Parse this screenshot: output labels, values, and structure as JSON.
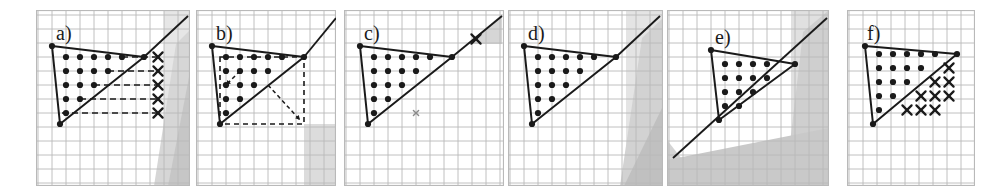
{
  "figure": {
    "panel_count": 6,
    "background_color": "#ffffff",
    "grid_color": "#b9b9b9",
    "ink_color": "#1a1a1a",
    "shade_light": "#e3e3e3",
    "shade_mid": "#d2d2d2",
    "shade_dark": "#bdbdbd"
  },
  "chart_data": {
    "type": "scatter",
    "xlabel": "",
    "ylabel": "",
    "grid": true,
    "legend": null,
    "panels": [
      {
        "id": "a",
        "label": "a)",
        "x": 36,
        "y": 10,
        "w": 154,
        "h": 176,
        "cell": 14,
        "triangle": [
          [
            16,
            36
          ],
          [
            24,
            114
          ],
          [
            108,
            47
          ]
        ],
        "ray_from": [
          108,
          47
        ],
        "ray_to": [
          152,
          6
        ],
        "dots": [
          [
            30,
            47
          ],
          [
            44,
            47
          ],
          [
            58,
            47
          ],
          [
            72,
            47
          ],
          [
            86,
            47
          ],
          [
            30,
            61
          ],
          [
            44,
            61
          ],
          [
            58,
            61
          ],
          [
            72,
            61
          ],
          [
            30,
            75
          ],
          [
            44,
            75
          ],
          [
            58,
            75
          ],
          [
            30,
            89
          ],
          [
            44,
            89
          ],
          [
            30,
            103
          ]
        ],
        "crosses": [
          [
            122,
            47
          ],
          [
            122,
            61
          ],
          [
            122,
            75
          ],
          [
            122,
            89
          ],
          [
            122,
            103
          ]
        ],
        "dashed_rows": [
          [
            86,
            47,
            122,
            47
          ],
          [
            72,
            61,
            122,
            61
          ],
          [
            58,
            75,
            122,
            75
          ],
          [
            44,
            89,
            122,
            89
          ],
          [
            26,
            103,
            122,
            103
          ]
        ],
        "shading": [
          {
            "shape": "poly",
            "points": "128,0 154,0 154,176 128,176",
            "tone": "#e6e6e6"
          },
          {
            "shape": "poly",
            "points": "140,34 154,20 154,176 118,176",
            "tone": "#d6d6d6"
          },
          {
            "shape": "poly",
            "points": "154,62 154,176 132,176",
            "tone": "#c6c6c6"
          }
        ]
      },
      {
        "id": "b",
        "label": "b)",
        "x": 196,
        "y": 10,
        "w": 140,
        "h": 176,
        "cell": 14,
        "triangle": [
          [
            16,
            36
          ],
          [
            24,
            114
          ],
          [
            108,
            47
          ]
        ],
        "ray_from": [
          108,
          47
        ],
        "ray_to": [
          140,
          8
        ],
        "dots": [
          [
            30,
            47
          ],
          [
            44,
            47
          ],
          [
            58,
            47
          ],
          [
            72,
            47
          ],
          [
            86,
            47
          ],
          [
            30,
            61
          ],
          [
            44,
            61
          ],
          [
            58,
            61
          ],
          [
            72,
            61
          ],
          [
            30,
            75
          ],
          [
            44,
            75
          ],
          [
            58,
            75
          ],
          [
            30,
            89
          ],
          [
            44,
            89
          ],
          [
            30,
            103
          ]
        ],
        "crosses": [],
        "dashed_box": [
          24,
          47,
          108,
          114
        ],
        "dashed_arrows": [
          [
            [
              44,
              61
            ],
            [
              30,
              75
            ]
          ],
          [
            [
              72,
              75
            ],
            [
              104,
              110
            ]
          ]
        ],
        "shading": [
          {
            "shape": "rect",
            "x": 108,
            "y": 114,
            "w": 32,
            "h": 62,
            "tone": "#dcdcdc"
          }
        ]
      },
      {
        "id": "c",
        "label": "c)",
        "x": 344,
        "y": 10,
        "w": 160,
        "h": 176,
        "cell": 14,
        "triangle": [
          [
            16,
            36
          ],
          [
            24,
            114
          ],
          [
            108,
            47
          ]
        ],
        "ray_from": [
          108,
          47
        ],
        "ray_to": [
          158,
          6
        ],
        "dots": [
          [
            30,
            47
          ],
          [
            44,
            47
          ],
          [
            58,
            47
          ],
          [
            72,
            47
          ],
          [
            86,
            47
          ],
          [
            30,
            61
          ],
          [
            44,
            61
          ],
          [
            58,
            61
          ],
          [
            72,
            61
          ],
          [
            30,
            75
          ],
          [
            44,
            75
          ],
          [
            58,
            75
          ],
          [
            30,
            89
          ],
          [
            44,
            89
          ],
          [
            30,
            103
          ]
        ],
        "crosses": [
          [
            132,
            29
          ]
        ],
        "small_marks": [
          [
            72,
            103
          ]
        ],
        "shading": [
          {
            "shape": "poly",
            "points": "124,34 158,4 158,34",
            "tone": "#d6d6d6"
          }
        ]
      },
      {
        "id": "d",
        "label": "d)",
        "x": 508,
        "y": 10,
        "w": 155,
        "h": 176,
        "cell": 14,
        "triangle": [
          [
            16,
            36
          ],
          [
            24,
            114
          ],
          [
            108,
            47
          ]
        ],
        "ray_from": [
          108,
          47
        ],
        "ray_to": [
          152,
          6
        ],
        "dots": [
          [
            30,
            47
          ],
          [
            44,
            47
          ],
          [
            58,
            47
          ],
          [
            72,
            47
          ],
          [
            86,
            47
          ],
          [
            30,
            61
          ],
          [
            44,
            61
          ],
          [
            58,
            61
          ],
          [
            72,
            61
          ],
          [
            30,
            75
          ],
          [
            44,
            75
          ],
          [
            58,
            75
          ],
          [
            30,
            89
          ],
          [
            44,
            89
          ],
          [
            30,
            103
          ]
        ],
        "crosses": [],
        "shading": [
          {
            "shape": "poly",
            "points": "118,0 155,0 155,176 118,176",
            "tone": "#e4e4e4"
          },
          {
            "shape": "poly",
            "points": "134,28 155,8 155,176 112,176",
            "tone": "#d2d2d2"
          },
          {
            "shape": "poly",
            "points": "155,96 155,176 116,176",
            "tone": "#c0c0c0"
          }
        ]
      },
      {
        "id": "e",
        "label": "e)",
        "x": 667,
        "y": 10,
        "w": 162,
        "h": 176,
        "cell": 14,
        "triangle": [
          [
            44,
            40
          ],
          [
            52,
            110
          ],
          [
            128,
            54
          ]
        ],
        "long_line": [
          [
            6,
            148
          ],
          [
            160,
            8
          ]
        ],
        "dots": [
          [
            58,
            54
          ],
          [
            72,
            54
          ],
          [
            86,
            54
          ],
          [
            100,
            54
          ],
          [
            58,
            68
          ],
          [
            72,
            68
          ],
          [
            86,
            68
          ],
          [
            100,
            68
          ],
          [
            58,
            82
          ],
          [
            72,
            82
          ],
          [
            86,
            82
          ],
          [
            58,
            96
          ],
          [
            72,
            96
          ]
        ],
        "crosses": [],
        "shading": [
          {
            "shape": "poly",
            "points": "124,0 162,0 162,176 124,176",
            "tone": "#e0e0e0"
          },
          {
            "shape": "poly",
            "points": "136,22 162,0 162,176 118,176",
            "tone": "#cfcfcf"
          },
          {
            "shape": "poly",
            "points": "0,130 36,176 0,176",
            "tone": "#d4d4d4"
          },
          {
            "shape": "poly",
            "points": "0,176 162,176 162,118 0,150",
            "tone": "#c9c9c9"
          }
        ]
      },
      {
        "id": "f",
        "label": "f)",
        "x": 847,
        "y": 10,
        "w": 128,
        "h": 176,
        "cell": 14,
        "triangle": [
          [
            18,
            36
          ],
          [
            26,
            114
          ],
          [
            110,
            44
          ]
        ],
        "ray_from": null,
        "ray_to": null,
        "dots": [
          [
            32,
            44
          ],
          [
            46,
            44
          ],
          [
            60,
            44
          ],
          [
            74,
            44
          ],
          [
            88,
            44
          ],
          [
            32,
            58
          ],
          [
            46,
            58
          ],
          [
            60,
            58
          ],
          [
            74,
            58
          ],
          [
            32,
            72
          ],
          [
            46,
            72
          ],
          [
            60,
            72
          ],
          [
            32,
            86
          ],
          [
            46,
            86
          ],
          [
            32,
            100
          ]
        ],
        "crosses": [
          [
            102,
            58
          ],
          [
            88,
            72
          ],
          [
            102,
            72
          ],
          [
            74,
            86
          ],
          [
            88,
            86
          ],
          [
            102,
            86
          ],
          [
            60,
            100
          ],
          [
            74,
            100
          ],
          [
            88,
            100
          ]
        ],
        "shading": []
      }
    ]
  }
}
